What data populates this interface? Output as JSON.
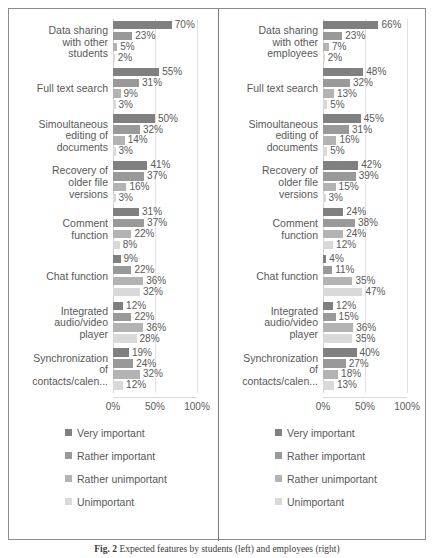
{
  "figure": {
    "caption_prefix": "Fig. 2",
    "caption_text": "Expected features by students (left) and employees (right)"
  },
  "axis": {
    "ticks": [
      "0%",
      "50%",
      "100%"
    ],
    "tick_values": [
      0,
      50,
      100
    ],
    "max": 100
  },
  "legend": {
    "items": [
      {
        "label": "Very important",
        "color": "#808080"
      },
      {
        "label": "Rather important",
        "color": "#999999"
      },
      {
        "label": "Rather unimportant",
        "color": "#b3b3b3"
      },
      {
        "label": "Unimportant",
        "color": "#d9d9d9"
      }
    ]
  },
  "chart_data": [
    {
      "type": "bar",
      "title": "Students",
      "orientation": "horizontal",
      "xlabel": "",
      "ylabel": "",
      "xlim": [
        0,
        100
      ],
      "grid": true,
      "legend_position": "bottom",
      "categories": [
        "Data sharing\nwith other\nstudents",
        "Full text search",
        "Simoultaneous\nediting of\ndocuments",
        "Recovery of\nolder file\nversions",
        "Comment\nfunction",
        "Chat function",
        "Integrated\naudio/video\nplayer",
        "Synchronization\nof\ncontacts/calen..."
      ],
      "series": [
        {
          "name": "Very important",
          "color": "#808080",
          "values": [
            70,
            55,
            50,
            41,
            31,
            9,
            12,
            19
          ],
          "labels": [
            "70%",
            "55%",
            "50%",
            "41%",
            "31%",
            "9%",
            "12%",
            "19%"
          ]
        },
        {
          "name": "Rather important",
          "color": "#999999",
          "values": [
            23,
            31,
            32,
            37,
            37,
            22,
            22,
            24
          ],
          "labels": [
            "23%",
            "31%",
            "32%",
            "37%",
            "37%",
            "22%",
            "22%",
            "24%"
          ]
        },
        {
          "name": "Rather unimportant",
          "color": "#b3b3b3",
          "values": [
            5,
            9,
            14,
            16,
            22,
            36,
            36,
            32
          ],
          "labels": [
            "5%",
            "9%",
            "14%",
            "16%",
            "22%",
            "36%",
            "36%",
            "32%"
          ]
        },
        {
          "name": "Unimportant",
          "color": "#d9d9d9",
          "values": [
            2,
            3,
            3,
            3,
            8,
            32,
            28,
            12
          ],
          "labels": [
            "2%",
            "3%",
            "3%",
            "3%",
            "8%",
            "32%",
            "28%",
            "12%"
          ]
        }
      ]
    },
    {
      "type": "bar",
      "title": "Employees",
      "orientation": "horizontal",
      "xlabel": "",
      "ylabel": "",
      "xlim": [
        0,
        100
      ],
      "grid": true,
      "legend_position": "bottom",
      "categories": [
        "Data sharing\nwith other\nemployees",
        "Full text search",
        "Simoultaneous\nediting of\ndocuments",
        "Recovery of\nolder file\nversions",
        "Comment\nfunction",
        "Chat function",
        "Integrated\naudio/video\nplayer",
        "Synchronization\nof\ncontacts/calen..."
      ],
      "series": [
        {
          "name": "Very important",
          "color": "#808080",
          "values": [
            66,
            48,
            45,
            42,
            24,
            4,
            12,
            40
          ],
          "labels": [
            "66%",
            "48%",
            "45%",
            "42%",
            "24%",
            "4%",
            "12%",
            "40%"
          ]
        },
        {
          "name": "Rather important",
          "color": "#999999",
          "values": [
            23,
            32,
            31,
            39,
            38,
            11,
            15,
            27
          ],
          "labels": [
            "23%",
            "32%",
            "31%",
            "39%",
            "38%",
            "11%",
            "15%",
            "27%"
          ]
        },
        {
          "name": "Rather unimportant",
          "color": "#b3b3b3",
          "values": [
            7,
            13,
            16,
            15,
            24,
            35,
            36,
            18
          ],
          "labels": [
            "7%",
            "13%",
            "16%",
            "15%",
            "24%",
            "35%",
            "36%",
            "18%"
          ]
        },
        {
          "name": "Unimportant",
          "color": "#d9d9d9",
          "values": [
            2,
            5,
            5,
            3,
            12,
            47,
            35,
            13
          ],
          "labels": [
            "2%",
            "5%",
            "5%",
            "3%",
            "12%",
            "47%",
            "35%",
            "13%"
          ]
        }
      ]
    }
  ]
}
